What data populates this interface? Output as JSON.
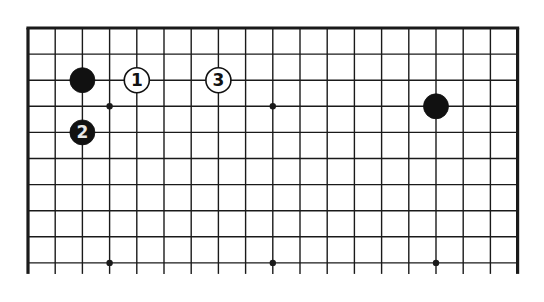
{
  "diagram": {
    "type": "go-board-fragment",
    "columns": 19,
    "rows_visible": 10,
    "edges": {
      "top": true,
      "left": true,
      "right": true,
      "bottom": false
    },
    "colors": {
      "line": "#1a1a1a",
      "black_stone": "#111111",
      "white_stone": "#ffffff",
      "background": "#ffffff"
    },
    "star_points": [
      {
        "col": 3,
        "row": 3
      },
      {
        "col": 9,
        "row": 3
      },
      {
        "col": 15,
        "row": 3
      },
      {
        "col": 3,
        "row": 9
      },
      {
        "col": 9,
        "row": 9
      },
      {
        "col": 15,
        "row": 9
      }
    ],
    "stones": [
      {
        "color": "black",
        "col": 2,
        "row": 2,
        "label": ""
      },
      {
        "color": "white",
        "col": 4,
        "row": 2,
        "label": "1"
      },
      {
        "color": "white",
        "col": 7,
        "row": 2,
        "label": "3"
      },
      {
        "color": "black",
        "col": 2,
        "row": 4,
        "label": "2"
      },
      {
        "color": "black",
        "col": 15,
        "row": 3,
        "label": ""
      }
    ]
  }
}
